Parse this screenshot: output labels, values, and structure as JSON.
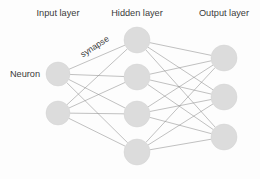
{
  "diagram": {
    "background_color": "#fdfdfd",
    "node_fill_color": "#dcdcdc",
    "edge_color": "#8d8d8d",
    "text_color": "#3a3a3a",
    "labels": {
      "input_layer": "Input layer",
      "hidden_layer": "Hidden layer",
      "output_layer": "Output layer",
      "neuron": "Neuron",
      "synapse": "synapse"
    },
    "layers": [
      {
        "id": "input",
        "label": "Input layer",
        "label_x": 58,
        "label_y": 14,
        "node_count": 2,
        "node_radius": 12,
        "nodes": [
          {
            "id": "i1",
            "cx": 58,
            "cy": 74
          },
          {
            "id": "i2",
            "cx": 58,
            "cy": 113
          }
        ]
      },
      {
        "id": "hidden",
        "label": "Hidden layer",
        "label_x": 137,
        "label_y": 14,
        "node_count": 4,
        "node_radius": 13,
        "nodes": [
          {
            "id": "h1",
            "cx": 137,
            "cy": 40
          },
          {
            "id": "h2",
            "cx": 137,
            "cy": 77
          },
          {
            "id": "h3",
            "cx": 137,
            "cy": 114
          },
          {
            "id": "h4",
            "cx": 137,
            "cy": 152
          }
        ]
      },
      {
        "id": "output",
        "label": "Output layer",
        "label_x": 224,
        "label_y": 14,
        "node_count": 3,
        "node_radius": 13,
        "nodes": [
          {
            "id": "o1",
            "cx": 224,
            "cy": 58
          },
          {
            "id": "o2",
            "cx": 224,
            "cy": 97
          },
          {
            "id": "o3",
            "cx": 224,
            "cy": 137
          }
        ]
      }
    ],
    "annotations": [
      {
        "id": "neuron",
        "text": "Neuron",
        "x": 25,
        "y": 75,
        "rotation": 0
      },
      {
        "id": "synapse",
        "text": "synapse",
        "x": 95,
        "y": 47,
        "rotation": -33
      }
    ],
    "connections": {
      "input_to_hidden": "fully-connected",
      "hidden_to_output": "fully-connected"
    }
  }
}
